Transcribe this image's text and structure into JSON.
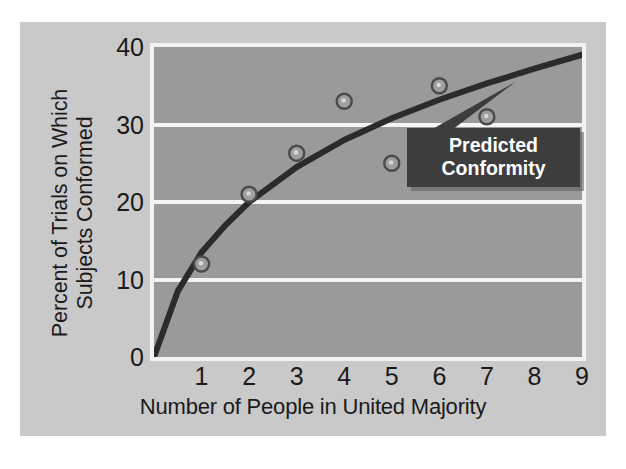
{
  "chart_data": {
    "type": "scatter",
    "title": "",
    "xlabel": "Number of People in United Majority",
    "ylabel_line1": "Percent of Trials on Which",
    "ylabel_line2": "Subjects Conformed",
    "xlim": [
      0,
      9
    ],
    "ylim": [
      0,
      40
    ],
    "xticks": [
      1,
      2,
      3,
      4,
      5,
      6,
      7,
      8,
      9
    ],
    "xtick_labels": [
      "1",
      "2",
      "3",
      "4",
      "5",
      "6",
      "7",
      "8",
      "9"
    ],
    "yticks": [
      0,
      10,
      20,
      30,
      40
    ],
    "ytick_labels": [
      "0",
      "10",
      "20",
      "30",
      "40"
    ],
    "grid": "horizontal",
    "legend_position": "none",
    "series": [
      {
        "name": "Observed Conformity",
        "type": "scatter",
        "x": [
          1,
          2,
          3,
          4,
          5,
          6,
          7
        ],
        "values": [
          12,
          21,
          26.3,
          33,
          25,
          35,
          31
        ]
      },
      {
        "name": "Predicted Conformity",
        "type": "line",
        "x": [
          0,
          0.5,
          1,
          1.5,
          2,
          3,
          4,
          5,
          6,
          7,
          8,
          9
        ],
        "values": [
          0,
          8.5,
          13.5,
          17,
          20,
          24.5,
          28,
          30.8,
          33.2,
          35.3,
          37.2,
          39
        ]
      }
    ],
    "annotations": [
      {
        "name": "predicted-conformity-callout",
        "line1": "Predicted",
        "line2": "Conformity",
        "points_to_x": 7.6,
        "points_to_y": 35.5
      }
    ],
    "colors": {
      "figure_background": "#c9c9c9",
      "plot_background": "#9a9a9a",
      "plot_border": "#f2f2f2",
      "gridline": "#f4f4f4",
      "curve": "#2b2b2b",
      "marker_fill": "#9e9e9e",
      "marker_edge": "#4a4a4a",
      "callout_background": "#3d3d3d",
      "callout_text": "#ffffff",
      "axis_text": "#1a1a1a"
    }
  }
}
